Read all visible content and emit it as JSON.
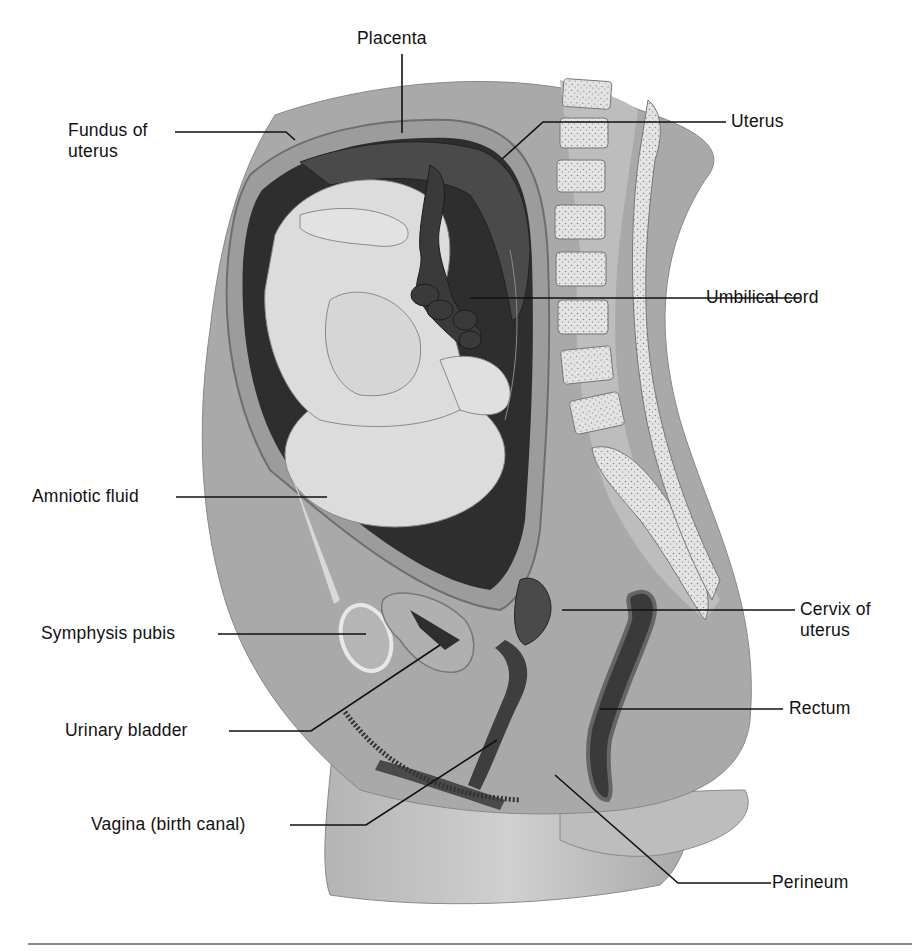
{
  "figure": {
    "labels": [
      {
        "id": "placenta",
        "lines": [
          "Placenta"
        ]
      },
      {
        "id": "fundus",
        "lines": [
          "Fundus of",
          "uterus"
        ]
      },
      {
        "id": "uterus",
        "lines": [
          "Uterus"
        ]
      },
      {
        "id": "umbilical",
        "lines": [
          "Umbilical cord"
        ]
      },
      {
        "id": "amniotic",
        "lines": [
          "Amniotic fluid"
        ]
      },
      {
        "id": "symphysis",
        "lines": [
          "Symphysis pubis"
        ]
      },
      {
        "id": "cervix",
        "lines": [
          "Cervix of",
          "uterus"
        ]
      },
      {
        "id": "bladder",
        "lines": [
          "Urinary bladder"
        ]
      },
      {
        "id": "rectum",
        "lines": [
          "Rectum"
        ]
      },
      {
        "id": "vagina",
        "lines": [
          "Vagina (birth canal)"
        ]
      },
      {
        "id": "perineum",
        "lines": [
          "Perineum"
        ]
      }
    ]
  },
  "colors": {
    "background": "#ffffff",
    "body_tissue": "#a9a9a9",
    "body_light": "#c8c8c8",
    "uterine_wall": "#9a9a9a",
    "amniotic_fluid": "#2e2e2e",
    "placenta": "#4a4a4a",
    "cord": "#3a3a3a",
    "fetus": "#dcdcdc",
    "bone": "#e2e2e2",
    "label_text": "#111111",
    "leader_line": "#111111"
  }
}
